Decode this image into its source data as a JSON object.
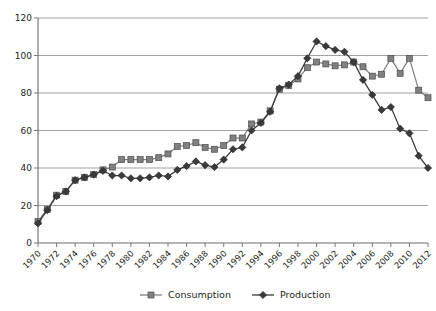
{
  "chart_data": {
    "type": "line",
    "title": "",
    "subtitle": "",
    "xlabel": "",
    "ylabel": "",
    "xlim": [
      1970,
      2012
    ],
    "ylim": [
      0,
      120
    ],
    "ytick_step": 20,
    "yticks": [
      0,
      20,
      40,
      60,
      80,
      100,
      120
    ],
    "xtick_step": 2,
    "xticks": [
      1970,
      1972,
      1974,
      1976,
      1978,
      1980,
      1982,
      1984,
      1986,
      1988,
      1990,
      1992,
      1994,
      1996,
      1998,
      2000,
      2002,
      2004,
      2006,
      2008,
      2010,
      2012
    ],
    "grid": "horizontal",
    "legend_position": "bottom",
    "x": [
      1970,
      1971,
      1972,
      1973,
      1974,
      1975,
      1976,
      1977,
      1978,
      1979,
      1980,
      1981,
      1982,
      1983,
      1984,
      1985,
      1986,
      1987,
      1988,
      1989,
      1990,
      1991,
      1992,
      1993,
      1994,
      1995,
      1996,
      1997,
      1998,
      1999,
      2000,
      2001,
      2002,
      2003,
      2004,
      2005,
      2006,
      2007,
      2008,
      2009,
      2010,
      2011,
      2012
    ],
    "series": [
      {
        "name": "Consumption",
        "marker": "square",
        "color": "#808080",
        "values": [
          11.5,
          18.0,
          25.5,
          27.5,
          33.5,
          35.0,
          36.5,
          39.0,
          40.5,
          44.5,
          44.5,
          44.5,
          44.5,
          45.5,
          47.5,
          51.5,
          52.0,
          53.5,
          51.0,
          50.0,
          52.0,
          56.0,
          56.0,
          63.5,
          64.5,
          70.5,
          82.0,
          84.0,
          87.5,
          93.5,
          96.5,
          95.5,
          94.5,
          95.0,
          96.5,
          94.0,
          89.0,
          90.0,
          98.5,
          90.5,
          98.5,
          81.5,
          77.5
        ]
      },
      {
        "name": "Production",
        "marker": "diamond",
        "color": "#3a3a3a",
        "values": [
          10.5,
          17.5,
          25.0,
          27.5,
          33.5,
          35.0,
          36.5,
          38.5,
          36.0,
          36.0,
          34.5,
          34.5,
          35.0,
          36.0,
          35.5,
          39.0,
          41.0,
          43.5,
          41.5,
          40.5,
          44.5,
          50.0,
          51.0,
          60.0,
          64.0,
          70.0,
          82.5,
          84.5,
          89.0,
          98.5,
          107.5,
          105.0,
          103.0,
          102.0,
          96.5,
          87.0,
          79.0,
          71.0,
          72.5,
          61.0,
          58.5,
          46.5,
          40.0
        ]
      }
    ]
  },
  "legend": {
    "items": [
      {
        "label": "Consumption",
        "marker": "square",
        "color": "#808080"
      },
      {
        "label": "Production",
        "marker": "diamond",
        "color": "#3a3a3a"
      }
    ]
  }
}
